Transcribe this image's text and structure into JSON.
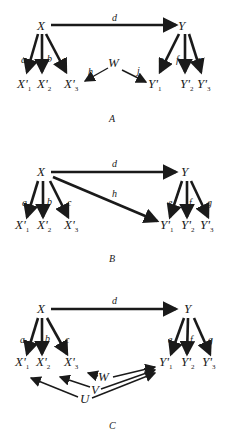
{
  "figure": {
    "panels": [
      {
        "caption": "A",
        "nodes": {
          "X": "X",
          "Y": "Υ",
          "W": "W",
          "X1": "X'",
          "X2": "X'",
          "X3": "X'",
          "Y1": "Υ'",
          "Y2": "Υ'",
          "Y3": "Υ'"
        },
        "subs": {
          "X1": "1",
          "X2": "2",
          "X3": "3",
          "Y1": "1",
          "Y2": "2",
          "Y3": "3"
        },
        "edges": {
          "d": "d",
          "a": "a",
          "b": "b",
          "c": "c",
          "e": "e",
          "f": "f",
          "g": "g",
          "h": "h",
          "j": "j"
        }
      },
      {
        "caption": "B",
        "nodes": {
          "X": "X",
          "Y": "Υ",
          "X1": "X'",
          "X2": "X'",
          "X3": "X'",
          "Y1": "Υ'",
          "Y2": "Υ'",
          "Y3": "Υ'"
        },
        "subs": {
          "X1": "1",
          "X2": "2",
          "X3": "3",
          "Y1": "1",
          "Y2": "2",
          "Y3": "3"
        },
        "edges": {
          "d": "d",
          "a": "a",
          "b": "b",
          "c": "c",
          "e": "e",
          "f": "f",
          "g": "g",
          "h": "h"
        }
      },
      {
        "caption": "C",
        "nodes": {
          "X": "X",
          "Y": "Υ",
          "W": "W",
          "V": "V",
          "U": "U",
          "X1": "X'",
          "X2": "X'",
          "X3": "X'",
          "Y1": "Υ'",
          "Y2": "Υ'",
          "Y3": "Υ'"
        },
        "subs": {
          "X1": "1",
          "X2": "2",
          "X3": "3",
          "Y1": "1",
          "Y2": "2",
          "Y3": "3"
        },
        "edges": {
          "d": "d",
          "a": "a",
          "b": "b",
          "c": "c",
          "e": "e",
          "f": "f",
          "g": "g"
        }
      }
    ]
  }
}
